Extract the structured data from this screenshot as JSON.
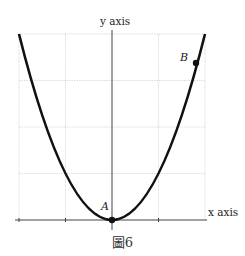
{
  "figure": {
    "caption": "圖6",
    "x_axis_label": "x axis",
    "y_axis_label": "y axis",
    "points": [
      {
        "name": "A",
        "x": 0,
        "y": 0
      },
      {
        "name": "B",
        "x": 1.8,
        "y": 3.24
      }
    ],
    "curve": "y = x^2",
    "x_range": [
      -2,
      2
    ],
    "y_range": [
      0,
      4
    ],
    "grid": true,
    "colors": {
      "curve": "#111111",
      "grid": "#cccccc",
      "axis": "#444444"
    }
  }
}
